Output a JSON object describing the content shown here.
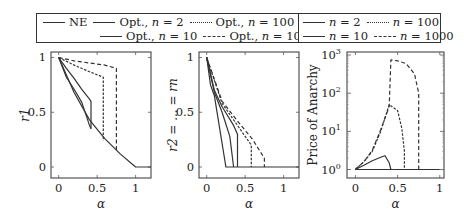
{
  "legend_left": {
    "entries": [
      {
        "label": "NE",
        "style": "solid"
      },
      {
        "label": "Opt., n = 2",
        "style": "solid"
      },
      {
        "label": "Opt., n = 100",
        "style": "dense-dash"
      },
      {
        "label": "Opt., n = 10",
        "style": "solid"
      },
      {
        "label": "Opt., n = 1000",
        "style": "dash"
      }
    ]
  },
  "legend_right": {
    "entries": [
      {
        "label": "n = 2",
        "style": "solid"
      },
      {
        "label": "n = 100",
        "style": "dense-dash"
      },
      {
        "label": "n = 10",
        "style": "solid"
      },
      {
        "label": "n = 1000",
        "style": "dash"
      }
    ]
  },
  "chart_data": [
    {
      "type": "line",
      "title": "",
      "xlabel": "α",
      "ylabel": "r1",
      "xlim": [
        -0.1,
        1.2
      ],
      "ylim": [
        -0.1,
        1.05
      ],
      "xticks": [
        "0",
        "0.5",
        "1"
      ],
      "yticks": [
        "0",
        "0.5",
        "1"
      ],
      "grid": false,
      "series": [
        {
          "name": "NE",
          "x": [
            0,
            0.2,
            0.4,
            0.6,
            0.8,
            1.0,
            1.2
          ],
          "y": [
            1.0,
            0.68,
            0.43,
            0.26,
            0.12,
            0.0,
            0.0
          ]
        },
        {
          "name": "Opt., n = 2",
          "x": [
            0,
            0.1,
            0.2,
            0.3,
            0.4,
            0.42
          ],
          "y": [
            1.0,
            0.82,
            0.71,
            0.59,
            0.38,
            0.35
          ]
        },
        {
          "name": "Opt., n = 10",
          "x": [
            0,
            0.1,
            0.2,
            0.3,
            0.4,
            0.42,
            0.42
          ],
          "y": [
            1.0,
            0.9,
            0.81,
            0.71,
            0.62,
            0.6,
            0.35
          ]
        },
        {
          "name": "Opt., n = 100",
          "x": [
            0,
            0.2,
            0.4,
            0.58,
            0.58
          ],
          "y": [
            1.0,
            0.93,
            0.87,
            0.82,
            0.24
          ]
        },
        {
          "name": "Opt., n = 1000",
          "x": [
            0,
            0.2,
            0.4,
            0.6,
            0.75,
            0.75
          ],
          "y": [
            1.0,
            0.97,
            0.95,
            0.93,
            0.9,
            0.15
          ]
        }
      ]
    },
    {
      "type": "line",
      "title": "",
      "xlabel": "α",
      "ylabel": "r2 = ... = rn",
      "xlim": [
        -0.1,
        1.2
      ],
      "ylim": [
        -0.1,
        1.05
      ],
      "xticks": [
        "0",
        "0.5",
        "1"
      ],
      "yticks": [
        "0",
        "0.5",
        "1"
      ],
      "grid": false,
      "series": [
        {
          "name": "n = 2",
          "x": [
            0,
            0.05,
            0.1,
            0.25,
            1.2
          ],
          "y": [
            1.0,
            0.75,
            0.65,
            0.0,
            0.0
          ]
        },
        {
          "name": "n = 10",
          "x": [
            0,
            0.1,
            0.2,
            0.3,
            0.35
          ],
          "y": [
            1.0,
            0.68,
            0.5,
            0.28,
            0.0
          ]
        },
        {
          "name": "n = 10b",
          "x": [
            0,
            0.1,
            0.2,
            0.35,
            0.4,
            0.4
          ],
          "y": [
            1.0,
            0.7,
            0.55,
            0.38,
            0.3,
            0.0
          ]
        },
        {
          "name": "n = 100",
          "x": [
            0,
            0.2,
            0.4,
            0.58,
            0.58
          ],
          "y": [
            1.0,
            0.58,
            0.38,
            0.2,
            0.0
          ]
        },
        {
          "name": "n = 1000",
          "x": [
            0,
            0.2,
            0.4,
            0.6,
            0.75,
            0.75
          ],
          "y": [
            1.0,
            0.6,
            0.42,
            0.25,
            0.08,
            0.0
          ]
        }
      ]
    },
    {
      "type": "line",
      "title": "",
      "xlabel": "α",
      "ylabel": "Price of Anarchy",
      "yscale": "log",
      "xlim": [
        -0.1,
        1.05
      ],
      "ylim": [
        0.6,
        1200
      ],
      "xticks": [
        "0",
        "0.5",
        "1"
      ],
      "yticks": [
        "10^0",
        "10^1",
        "10^2",
        "10^3"
      ],
      "grid": false,
      "series": [
        {
          "name": "n = 2",
          "x": [
            0,
            0.2,
            0.4,
            1.0
          ],
          "y": [
            1.0,
            1.0,
            1.0,
            1.0
          ]
        },
        {
          "name": "n = 10",
          "x": [
            0,
            0.1,
            0.2,
            0.3,
            0.35,
            0.4,
            0.42
          ],
          "y": [
            1.0,
            1.3,
            1.7,
            2.1,
            2.3,
            1.5,
            1.0
          ]
        },
        {
          "name": "n = 100",
          "x": [
            0,
            0.1,
            0.2,
            0.3,
            0.4,
            0.5,
            0.55,
            0.58,
            0.58
          ],
          "y": [
            1.0,
            1.6,
            3.0,
            10,
            50,
            35,
            12,
            3,
            1.0
          ]
        },
        {
          "name": "n = 1000",
          "x": [
            0,
            0.1,
            0.2,
            0.3,
            0.4,
            0.42,
            0.5,
            0.6,
            0.7,
            0.75,
            0.75
          ],
          "y": [
            1.0,
            1.6,
            3.2,
            11,
            45,
            750,
            700,
            600,
            320,
            100,
            1.0
          ]
        }
      ]
    }
  ]
}
